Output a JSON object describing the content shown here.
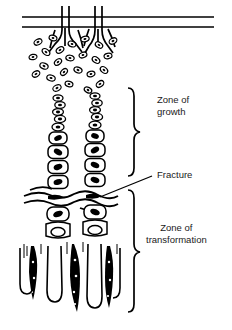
{
  "figure": {
    "background_color": "#ffffff",
    "ink_color": "#000000",
    "width": 232,
    "height": 330
  },
  "labels": {
    "zone_of_growth": "Zone of\ngrowth",
    "zone_of_growth_line1": "Zone of",
    "zone_of_growth_line2": "growth",
    "fracture": "Fracture",
    "zone_of_transformation_line1": "Zone of",
    "zone_of_transformation_line2": "transformation"
  },
  "annotations": [
    {
      "name": "brace-zone-of-growth",
      "type": "curly-brace",
      "span_top": 88,
      "span_bottom": 176
    },
    {
      "name": "leader-fracture",
      "type": "leader-line",
      "from_x": 100,
      "from_y": 196,
      "to_x": 152,
      "to_y": 175
    },
    {
      "name": "brace-zone-of-transformation",
      "type": "curly-brace",
      "span_top": 190,
      "span_bottom": 312
    }
  ],
  "structures": [
    {
      "name": "periosteum-lines",
      "description": "two horizontal parallel lines at top"
    },
    {
      "name": "vascular-channels",
      "description": "branching vessels crossing periosteum"
    },
    {
      "name": "resting-chondrocytes",
      "description": "scattered small oval cells with dark nuclei"
    },
    {
      "name": "proliferative-columns",
      "description": "two vertical columns of stacked cells"
    },
    {
      "name": "hypertrophic-cells",
      "description": "enlarged rectangular cells with dark nuclei"
    },
    {
      "name": "fracture-line",
      "description": "irregular wavy horizontal cleft"
    },
    {
      "name": "bone-trabeculae",
      "description": "dark vertical mineralized spicules"
    },
    {
      "name": "capillary-loops",
      "description": "U-shaped vascular loops at base"
    }
  ]
}
